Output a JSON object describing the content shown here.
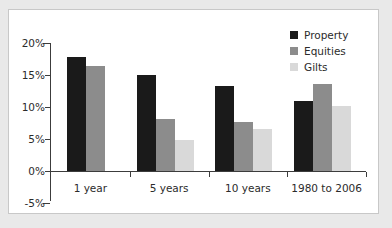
{
  "chart_data": {
    "type": "bar",
    "title": "",
    "subtitle": "",
    "xlabel": "",
    "ylabel": "",
    "categories": [
      "1 year",
      "5 years",
      "10 years",
      "1980 to 2006"
    ],
    "series": [
      {
        "name": "Property",
        "color": "#1a1a1a",
        "values": [
          17.8,
          15.0,
          13.3,
          11.0
        ]
      },
      {
        "name": "Equities",
        "color": "#8c8c8c",
        "values": [
          16.4,
          8.2,
          7.7,
          13.6
        ]
      },
      {
        "name": "Gilts",
        "color": "#d9d9d9",
        "values": [
          null,
          4.9,
          6.6,
          10.2
        ]
      }
    ],
    "ylim": [
      -5,
      20
    ],
    "ytick_values": [
      20,
      15,
      10,
      5,
      0,
      -5
    ],
    "ytick_labels": [
      "20%",
      "15%",
      "10%",
      "5%",
      "0%",
      "-5%"
    ],
    "grid": false,
    "legend_position": "top-right",
    "value_suffix": "%"
  },
  "legend": {
    "entries": [
      {
        "label": "Property"
      },
      {
        "label": "Equities"
      },
      {
        "label": "Gilts"
      }
    ]
  }
}
